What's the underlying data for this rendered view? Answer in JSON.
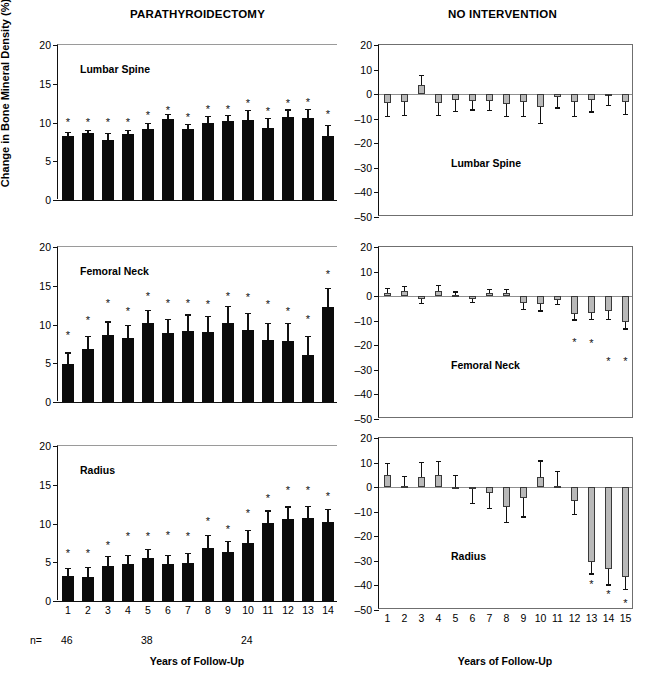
{
  "figure": {
    "y_axis_title": "Change in Bone Mineral Density (%)",
    "x_axis_title": "Years of Follow-Up",
    "columns": [
      {
        "key": "parathyroidectomy",
        "title": "PARATHYROIDECTOMY"
      },
      {
        "key": "no_intervention",
        "title": "NO INTERVENTION"
      }
    ],
    "n_row": {
      "label": "n=",
      "entries": [
        {
          "value": "46",
          "at_year": 1
        },
        {
          "value": "38",
          "at_year": 5
        },
        {
          "value": "24",
          "at_year": 10
        }
      ]
    },
    "colors": {
      "solid_bar": "#0b0b0b",
      "gray_bar": "#b9b9b9",
      "bar_border": "#3a3a3a",
      "axis": "#111111",
      "gridline": "#8f8f8f"
    }
  },
  "chart_data": [
    {
      "type": "bar",
      "panel": "parathyroidectomy-lumbar-spine",
      "title": "PARATHYROIDECTOMY",
      "annotation": "Lumbar Spine",
      "xlabel": "Years of Follow-Up",
      "ylabel": "Change in Bone Mineral Density (%)",
      "ylim": [
        0,
        20
      ],
      "yticks": [
        0,
        5,
        10,
        15,
        20
      ],
      "categories": [
        1,
        2,
        3,
        4,
        5,
        6,
        7,
        8,
        9,
        10,
        11,
        12,
        13,
        14
      ],
      "values": [
        8.3,
        8.6,
        7.7,
        8.5,
        9.2,
        10.4,
        9.1,
        9.9,
        10.2,
        10.3,
        9.3,
        10.7,
        10.6,
        8.3
      ],
      "errors": [
        0.5,
        0.4,
        1.0,
        0.5,
        0.8,
        0.7,
        0.7,
        0.9,
        0.8,
        1.3,
        1.3,
        1.0,
        1.2,
        1.4
      ],
      "significance": [
        true,
        true,
        true,
        true,
        true,
        true,
        true,
        true,
        true,
        true,
        true,
        true,
        true,
        true
      ],
      "star_y": [
        10.0,
        10.0,
        9.9,
        9.9,
        10.8,
        11.5,
        10.6,
        11.6,
        11.6,
        12.4,
        11.4,
        12.4,
        12.5,
        11.0
      ]
    },
    {
      "type": "bar",
      "panel": "parathyroidectomy-femoral-neck",
      "annotation": "Femoral Neck",
      "ylim": [
        0,
        20
      ],
      "yticks": [
        0,
        5,
        10,
        15,
        20
      ],
      "categories": [
        1,
        2,
        3,
        4,
        5,
        6,
        7,
        8,
        9,
        10,
        11,
        12,
        13,
        14
      ],
      "values": [
        4.9,
        6.9,
        8.7,
        8.3,
        10.2,
        8.9,
        9.2,
        9.0,
        10.2,
        9.3,
        8.0,
        7.9,
        6.1,
        12.2
      ],
      "errors": [
        1.5,
        1.6,
        1.7,
        1.6,
        1.7,
        1.8,
        2.1,
        2.1,
        2.2,
        2.2,
        2.2,
        2.3,
        2.4,
        2.5
      ],
      "significance": [
        true,
        true,
        true,
        true,
        true,
        true,
        true,
        true,
        true,
        true,
        true,
        true,
        true,
        true
      ],
      "star_y": [
        8.5,
        10.5,
        12.7,
        11.6,
        13.5,
        12.6,
        12.6,
        12.5,
        13.6,
        13.4,
        12.5,
        11.6,
        10.6,
        16.4
      ]
    },
    {
      "type": "bar",
      "panel": "parathyroidectomy-radius",
      "annotation": "Radius",
      "ylim": [
        0,
        20
      ],
      "yticks": [
        0,
        5,
        10,
        15,
        20
      ],
      "categories": [
        1,
        2,
        3,
        4,
        5,
        6,
        7,
        8,
        9,
        10,
        11,
        12,
        13,
        14
      ],
      "values": [
        3.2,
        3.1,
        4.5,
        4.8,
        5.5,
        4.8,
        4.9,
        6.9,
        6.3,
        7.5,
        10.1,
        10.6,
        10.7,
        10.2
      ],
      "errors": [
        1.1,
        1.3,
        1.3,
        1.1,
        1.2,
        1.1,
        1.3,
        1.6,
        1.5,
        1.7,
        1.6,
        1.6,
        1.6,
        1.7
      ],
      "significance": [
        true,
        true,
        true,
        true,
        true,
        true,
        true,
        true,
        true,
        true,
        true,
        true,
        true,
        true
      ],
      "star_y": [
        6.1,
        6.1,
        7.1,
        8.2,
        8.2,
        8.4,
        8.3,
        10.2,
        9.2,
        11.2,
        13.2,
        14.2,
        14.2,
        13.4
      ]
    },
    {
      "type": "bar",
      "panel": "no-intervention-lumbar-spine",
      "title": "NO INTERVENTION",
      "annotation": "Lumbar Spine",
      "xlabel": "Years of Follow-Up",
      "ylim": [
        -50,
        20
      ],
      "yticks": [
        20,
        10,
        0,
        -10,
        -20,
        -30,
        -40,
        -50
      ],
      "categories": [
        1,
        2,
        3,
        4,
        5,
        6,
        7,
        8,
        9,
        10,
        11,
        12,
        13,
        14,
        15
      ],
      "values": [
        -3.8,
        -3.4,
        3.8,
        -3.5,
        -2.3,
        -2.7,
        -2.8,
        -3.9,
        -3.3,
        -5.2,
        -1.1,
        -3.3,
        -2.4,
        -0.5,
        -3.2
      ],
      "errors": [
        5.0,
        5.2,
        4.0,
        4.9,
        4.6,
        3.5,
        3.6,
        5.0,
        5.4,
        6.6,
        4.3,
        5.6,
        4.6,
        3.8,
        5.0
      ],
      "significance": [
        false,
        false,
        false,
        false,
        false,
        false,
        false,
        false,
        false,
        false,
        false,
        false,
        false,
        false,
        false
      ]
    },
    {
      "type": "bar",
      "panel": "no-intervention-femoral-neck",
      "annotation": "Femoral Neck",
      "ylim": [
        -50,
        20
      ],
      "yticks": [
        20,
        10,
        0,
        -10,
        -20,
        -30,
        -40,
        -50
      ],
      "categories": [
        1,
        2,
        3,
        4,
        5,
        6,
        7,
        8,
        9,
        10,
        11,
        12,
        13,
        14,
        15
      ],
      "values": [
        1.4,
        2.0,
        -1.3,
        2.2,
        0.6,
        -1.2,
        1.3,
        1.3,
        -2.7,
        -3.0,
        -1.5,
        -7.3,
        -7.0,
        -6.0,
        -10.6
      ],
      "errors": [
        2.0,
        2.2,
        1.5,
        2.4,
        1.3,
        1.1,
        1.6,
        1.6,
        2.5,
        2.8,
        1.8,
        2.2,
        2.2,
        3.4,
        2.5
      ],
      "significance": [
        false,
        false,
        false,
        false,
        false,
        false,
        false,
        false,
        false,
        false,
        false,
        true,
        true,
        true,
        true
      ],
      "star_y": [
        null,
        null,
        null,
        null,
        null,
        null,
        null,
        null,
        null,
        null,
        null,
        -19.0,
        -19.5,
        -27.0,
        -26.8
      ]
    },
    {
      "type": "bar",
      "panel": "no-intervention-radius",
      "annotation": "Radius",
      "ylim": [
        -50,
        20
      ],
      "yticks": [
        20,
        10,
        0,
        -10,
        -20,
        -30,
        -40,
        -50
      ],
      "categories": [
        1,
        2,
        3,
        4,
        5,
        6,
        7,
        8,
        9,
        10,
        11,
        12,
        13,
        14,
        15
      ],
      "values": [
        4.8,
        0.3,
        4.2,
        4.9,
        0.2,
        -0.8,
        -2.2,
        -8.0,
        -4.6,
        4.1,
        0.3,
        -5.5,
        -30.3,
        -33.3,
        -36.5
      ],
      "errors": [
        5.2,
        4.4,
        6.1,
        5.9,
        4.8,
        5.5,
        6.3,
        6.2,
        7.3,
        6.8,
        6.2,
        5.5,
        4.8,
        6.3,
        4.8
      ],
      "significance": [
        false,
        false,
        false,
        false,
        false,
        false,
        false,
        false,
        false,
        false,
        false,
        false,
        true,
        true,
        true
      ],
      "star_y": [
        null,
        null,
        null,
        null,
        null,
        null,
        null,
        null,
        null,
        null,
        null,
        null,
        -40.0,
        -44.0,
        -47.5
      ]
    }
  ]
}
